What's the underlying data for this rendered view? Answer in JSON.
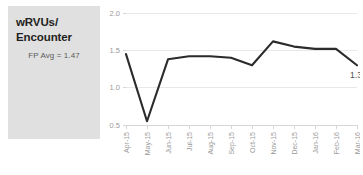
{
  "panel": {
    "title_line1": "wRVUs/",
    "title_line2": "Encounter",
    "subtitle": "FP Avg = 1.47",
    "background_color": "#e0e0e0"
  },
  "chart_data": {
    "type": "line",
    "title": "wRVUs/ Encounter",
    "subtitle": "FP Avg = 1.47",
    "xlabel": "",
    "ylabel": "",
    "categories": [
      "Apr-15",
      "May-15",
      "Jun-15",
      "Jul-15",
      "Aug-15",
      "Sep-15",
      "Oct-15",
      "Nov-15",
      "Dec-15",
      "Jan-16",
      "Feb-16",
      "Mar-16"
    ],
    "values": [
      1.45,
      0.55,
      1.38,
      1.42,
      1.42,
      1.4,
      1.3,
      1.62,
      1.55,
      1.52,
      1.52,
      1.3
    ],
    "series": [
      {
        "name": "wRVUs per Encounter",
        "values": [
          1.45,
          0.55,
          1.38,
          1.42,
          1.42,
          1.4,
          1.3,
          1.62,
          1.55,
          1.52,
          1.52,
          1.3
        ],
        "color": "#2b2b2b"
      }
    ],
    "ylim": [
      0.5,
      2.0
    ],
    "yticks": [
      0.5,
      1.0,
      1.5,
      2.0
    ],
    "ytick_labels": [
      "0.5",
      "1.0",
      "1.5",
      "2.0"
    ],
    "grid": true,
    "legend": false,
    "legend_position": "none",
    "data_labels": [
      {
        "category": "Mar-16",
        "value": 1.3,
        "text": "1.3"
      }
    ],
    "reference_value": 1.47,
    "reference_label": "FP Avg = 1.47",
    "line_color": "#2b2b2b",
    "gridline_color": "#e8e8e8",
    "axis_color": "#d6d6d6",
    "tick_label_color": "#9a9a9a"
  }
}
